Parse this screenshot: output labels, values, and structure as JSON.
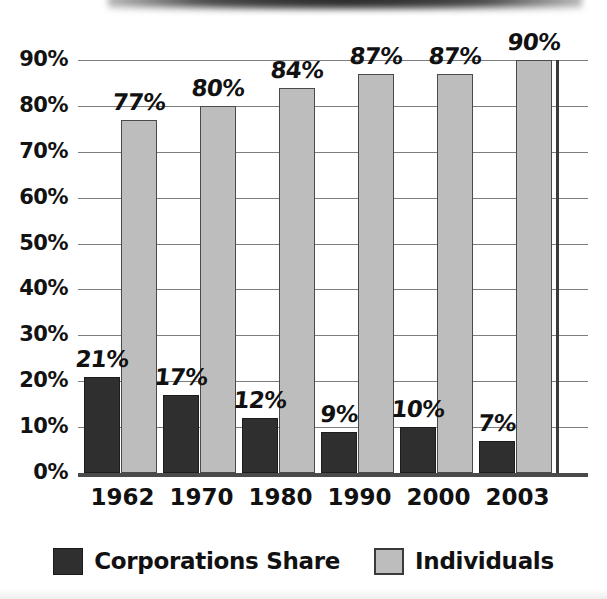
{
  "chart_data": {
    "type": "bar",
    "title": "",
    "subtitle": "",
    "xlabel": "",
    "ylabel": "",
    "categories": [
      "1962",
      "1970",
      "1980",
      "1990",
      "2000",
      "2003"
    ],
    "series": [
      {
        "name": "Corporations Share",
        "color": "#2f2f2f",
        "values": [
          21,
          17,
          12,
          9,
          10,
          7
        ],
        "labels": [
          "21%",
          "17%",
          "12%",
          "9%",
          "10%",
          "7%"
        ]
      },
      {
        "name": "Individuals",
        "color": "#bdbdbd",
        "values": [
          77,
          80,
          84,
          87,
          87,
          90
        ],
        "labels": [
          "77%",
          "80%",
          "84%",
          "87%",
          "87%",
          "90%"
        ]
      }
    ],
    "ylim": [
      0,
      90
    ],
    "ytick_values": [
      0,
      10,
      20,
      30,
      40,
      50,
      60,
      70,
      80,
      90
    ],
    "ytick_labels": [
      "0%",
      "10%",
      "20%",
      "30%",
      "40%",
      "50%",
      "60%",
      "70%",
      "80%",
      "90%"
    ],
    "grid": true,
    "legend_position": "bottom",
    "value_labels": true
  },
  "legend": {
    "items": [
      {
        "label": "Corporations Share",
        "swatch": "dark-square-swatch"
      },
      {
        "label": "Individuals",
        "swatch": "gray-square-swatch"
      }
    ]
  }
}
